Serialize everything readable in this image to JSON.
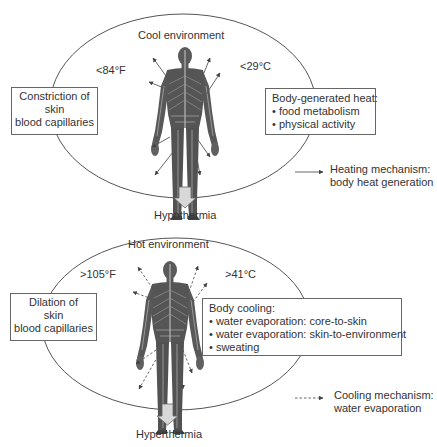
{
  "cool_panel": {
    "title": "Cool environment",
    "temp_f": "<84°F",
    "temp_c": "<29°C",
    "left_box": [
      "Constriction of",
      "skin",
      "blood capillaries"
    ],
    "right_box": {
      "heading": "Body-generated heat:",
      "items": [
        "• food metabolism",
        "• physical activity"
      ]
    },
    "outcome": "Hypothermia",
    "arrow_style": "solid"
  },
  "hot_panel": {
    "title": "Hot environment",
    "temp_f": ">105°F",
    "temp_c": ">41°C",
    "left_box": [
      "Dilation of",
      "skin",
      "blood capillaries"
    ],
    "right_box": {
      "heading": "Body cooling:",
      "items": [
        "• water evaporation: core-to-skin",
        "• water evaporation: skin-to-environment",
        "• sweating"
      ]
    },
    "outcome": "Hyperthermia",
    "arrow_style": "dashed"
  },
  "legend": {
    "heating": [
      "Heating mechanism:",
      "body heat generation"
    ],
    "cooling": [
      "Cooling mechanism:",
      "water evaporation"
    ]
  },
  "colors": {
    "line": "#555555",
    "body": "#5a5a5a",
    "outcome_arrow_fill": "#d8d8d8"
  }
}
